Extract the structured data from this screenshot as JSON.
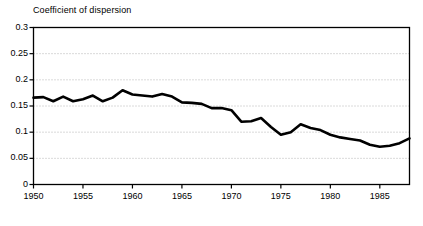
{
  "chart_data": {
    "type": "line",
    "title": "Coefficient of dispersion",
    "xlabel": "",
    "ylabel": "",
    "xlim": [
      1950,
      1988
    ],
    "ylim": [
      0,
      0.3
    ],
    "grid": true,
    "legend": null,
    "y_ticks": [
      0,
      0.05,
      0.1,
      0.15,
      0.2,
      0.25,
      0.3
    ],
    "y_tick_labels": [
      "0",
      "0.05",
      "0.1",
      "0.15",
      "0.2",
      "0.25",
      "0.3"
    ],
    "x_ticks": [
      1950,
      1955,
      1960,
      1965,
      1970,
      1975,
      1980,
      1985
    ],
    "x_tick_labels": [
      "1950",
      "1955",
      "1960",
      "1965",
      "1970",
      "1975",
      "1980",
      "1985"
    ],
    "series": [
      {
        "name": "Coefficient of dispersion",
        "color": "#000000",
        "x": [
          1950,
          1951,
          1952,
          1953,
          1954,
          1955,
          1956,
          1957,
          1958,
          1959,
          1960,
          1961,
          1962,
          1963,
          1964,
          1965,
          1966,
          1967,
          1968,
          1969,
          1970,
          1971,
          1972,
          1973,
          1974,
          1975,
          1976,
          1977,
          1978,
          1979,
          1980,
          1981,
          1982,
          1983,
          1984,
          1985,
          1986,
          1987,
          1988
        ],
        "values": [
          0.166,
          0.167,
          0.159,
          0.168,
          0.159,
          0.163,
          0.17,
          0.159,
          0.166,
          0.18,
          0.172,
          0.17,
          0.168,
          0.173,
          0.168,
          0.157,
          0.156,
          0.154,
          0.146,
          0.146,
          0.142,
          0.12,
          0.121,
          0.127,
          0.11,
          0.095,
          0.1,
          0.115,
          0.108,
          0.104,
          0.095,
          0.09,
          0.087,
          0.084,
          0.076,
          0.072,
          0.074,
          0.079,
          0.088
        ]
      }
    ]
  },
  "axes": {
    "frame_color": "#000000",
    "grid_color": "#b4b4b4",
    "line_color": "#000000",
    "line_width": 2.6
  }
}
